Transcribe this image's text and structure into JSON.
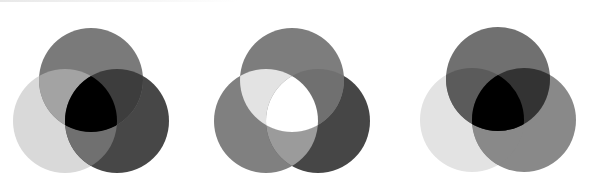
{
  "figure": {
    "background": "#ffffff",
    "diagrams": [
      {
        "id": "venn-1",
        "circles": {
          "top": {
            "cx": 91,
            "cy": 80,
            "r": 52
          },
          "left": {
            "cx": 65,
            "cy": 121,
            "r": 52
          },
          "right": {
            "cx": 117,
            "cy": 121,
            "r": 52
          }
        },
        "fills": {
          "top": "#7a7a7a",
          "left": "#d9d9d9",
          "right": "#474747",
          "top_left": "#a3a3a3",
          "top_right": "#3d3d3d",
          "left_right": "#707070",
          "center": "#000000"
        }
      },
      {
        "id": "venn-2",
        "circles": {
          "top": {
            "cx": 292,
            "cy": 80,
            "r": 52
          },
          "left": {
            "cx": 266,
            "cy": 121,
            "r": 52
          },
          "right": {
            "cx": 318,
            "cy": 121,
            "r": 52
          }
        },
        "fills": {
          "top": "#7d7d7d",
          "left": "#808080",
          "right": "#464646",
          "top_left": "#e3e3e3",
          "top_right": "#707070",
          "left_right": "#9b9b9b",
          "center": "#ffffff"
        }
      },
      {
        "id": "venn-3",
        "circles": {
          "top": {
            "cx": 498,
            "cy": 79,
            "r": 52
          },
          "left": {
            "cx": 472,
            "cy": 120,
            "r": 52
          },
          "right": {
            "cx": 524,
            "cy": 120,
            "r": 52
          }
        },
        "fills": {
          "top": "#707070",
          "left": "#e3e3e3",
          "right": "#898989",
          "top_left": "#5b5b5b",
          "top_right": "#333333",
          "left_right": "#898989",
          "center": "#000000"
        }
      }
    ]
  }
}
